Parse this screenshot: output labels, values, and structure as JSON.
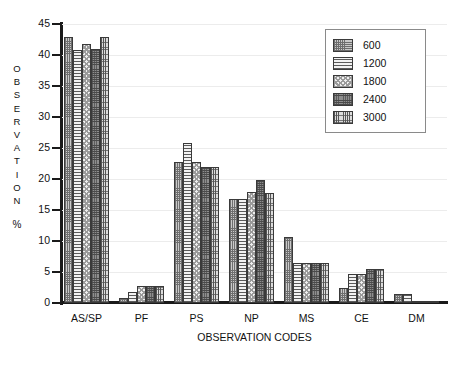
{
  "chart_data": {
    "type": "bar",
    "title": "",
    "xlabel": "OBSERVATION CODES",
    "ylabel": "OBSERVATION %",
    "ylabel_letters": [
      "O",
      "B",
      "S",
      "E",
      "R",
      "V",
      "A",
      "T",
      "I",
      "O",
      "N"
    ],
    "ylabel_suffix": "%",
    "categories": [
      "AS/SP",
      "PF",
      "PS",
      "NP",
      "MS",
      "CE",
      "DM"
    ],
    "ylim": [
      0,
      45
    ],
    "yticks": [
      0,
      5,
      10,
      15,
      20,
      25,
      30,
      35,
      40,
      45
    ],
    "ytick_labels": [
      "0",
      "5",
      "10",
      "15",
      "20",
      "25",
      "30",
      "35",
      "40",
      "45"
    ],
    "grid": true,
    "legend_position": "top-right",
    "series": [
      {
        "name": "600",
        "pattern": "fine-cross-grey",
        "values": [
          42.9,
          0.8,
          22.8,
          16.7,
          10.7,
          2.5,
          1.5
        ]
      },
      {
        "name": "1200",
        "pattern": "horizontal-lines",
        "values": [
          40.8,
          1.8,
          25.8,
          16.7,
          6.5,
          4.6,
          1.5
        ]
      },
      {
        "name": "1800",
        "pattern": "light-checkerboard",
        "values": [
          41.8,
          2.7,
          22.8,
          17.9,
          6.5,
          4.6,
          0.4
        ]
      },
      {
        "name": "2400",
        "pattern": "dense-dark-speckle",
        "values": [
          40.9,
          2.7,
          21.9,
          19.8,
          6.5,
          5.5,
          0.4
        ]
      },
      {
        "name": "3000",
        "pattern": "vertical-grid",
        "values": [
          42.9,
          2.7,
          21.9,
          17.7,
          6.5,
          5.5,
          0.4
        ]
      }
    ]
  },
  "legend": {
    "entries": [
      {
        "label": "600"
      },
      {
        "label": "1200"
      },
      {
        "label": "1800"
      },
      {
        "label": "2400"
      },
      {
        "label": "3000"
      }
    ]
  },
  "colors": {
    "axis": "#1a1a1a",
    "grid": "#ececec",
    "text": "#111111",
    "legend_border": "#8a8a8a",
    "bar_outline": "#3a3a3a",
    "background": "#ffffff"
  }
}
